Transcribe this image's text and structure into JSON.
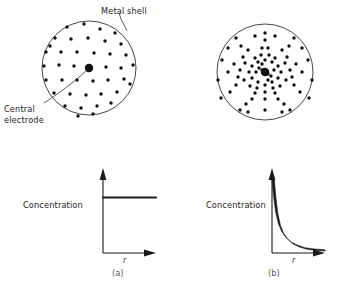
{
  "figure": {
    "caption_a": "(a)",
    "caption_b": "(b)"
  },
  "annotations": {
    "metal_shell": "Metal shell",
    "central_electrode_line1": "Central",
    "central_electrode_line2": "electrode"
  },
  "colors": {
    "line": "#1a1a1a",
    "dot": "#111111",
    "circle_stroke": "#333333",
    "text": "#222222",
    "background": "#ffffff"
  },
  "panel_a": {
    "circle": {
      "cx": 89,
      "cy": 68,
      "r": 47
    },
    "electrode": {
      "cx": 89,
      "cy": 68,
      "r": 4.2
    },
    "dot_radius": 1.7,
    "distribution": "uniform",
    "dots": [
      [
        67,
        27
      ],
      [
        84,
        24
      ],
      [
        100,
        29
      ],
      [
        115,
        33
      ],
      [
        55,
        38
      ],
      [
        71,
        39
      ],
      [
        88,
        38
      ],
      [
        105,
        41
      ],
      [
        121,
        44
      ],
      [
        46,
        52
      ],
      [
        61,
        52
      ],
      [
        77,
        52
      ],
      [
        94,
        53
      ],
      [
        110,
        54
      ],
      [
        126,
        55
      ],
      [
        44,
        66
      ],
      [
        59,
        65
      ],
      [
        74,
        66
      ],
      [
        106,
        67
      ],
      [
        121,
        68
      ],
      [
        133,
        65
      ],
      [
        46,
        80
      ],
      [
        62,
        80
      ],
      [
        77,
        80
      ],
      [
        93,
        81
      ],
      [
        108,
        80
      ],
      [
        124,
        79
      ],
      [
        54,
        93
      ],
      [
        70,
        94
      ],
      [
        86,
        95
      ],
      [
        101,
        94
      ],
      [
        117,
        92
      ],
      [
        65,
        106
      ],
      [
        81,
        108
      ],
      [
        97,
        106
      ],
      [
        111,
        103
      ],
      [
        78,
        116
      ],
      [
        93,
        114
      ],
      [
        50,
        46
      ],
      [
        130,
        84
      ],
      [
        88,
        70
      ]
    ]
  },
  "panel_b": {
    "circle": {
      "cx": 265,
      "cy": 72,
      "r": 48
    },
    "electrode": {
      "cx": 265,
      "cy": 72,
      "r": 4.2
    },
    "dot_radius": 1.7,
    "distribution": "radially-decaying",
    "dots": [
      [
        265,
        60
      ],
      [
        258,
        62
      ],
      [
        272,
        62
      ],
      [
        252,
        66
      ],
      [
        278,
        66
      ],
      [
        255,
        58
      ],
      [
        275,
        58
      ],
      [
        249,
        72
      ],
      [
        281,
        72
      ],
      [
        252,
        78
      ],
      [
        278,
        78
      ],
      [
        258,
        82
      ],
      [
        272,
        82
      ],
      [
        265,
        85
      ],
      [
        261,
        55
      ],
      [
        269,
        55
      ],
      [
        245,
        63
      ],
      [
        285,
        63
      ],
      [
        244,
        80
      ],
      [
        286,
        80
      ],
      [
        257,
        88
      ],
      [
        273,
        88
      ],
      [
        265,
        92
      ],
      [
        250,
        86
      ],
      [
        280,
        86
      ],
      [
        240,
        70
      ],
      [
        290,
        70
      ],
      [
        243,
        57
      ],
      [
        287,
        57
      ],
      [
        238,
        77
      ],
      [
        292,
        77
      ],
      [
        248,
        50
      ],
      [
        282,
        50
      ],
      [
        262,
        48
      ],
      [
        268,
        48
      ],
      [
        255,
        93
      ],
      [
        275,
        93
      ],
      [
        234,
        64
      ],
      [
        296,
        64
      ],
      [
        236,
        85
      ],
      [
        294,
        85
      ],
      [
        265,
        99
      ],
      [
        252,
        99
      ],
      [
        278,
        99
      ],
      [
        228,
        72
      ],
      [
        302,
        72
      ],
      [
        241,
        46
      ],
      [
        289,
        46
      ],
      [
        246,
        104
      ],
      [
        284,
        104
      ],
      [
        222,
        60
      ],
      [
        308,
        60
      ],
      [
        230,
        92
      ],
      [
        300,
        92
      ],
      [
        265,
        40
      ],
      [
        240,
        110
      ],
      [
        290,
        110
      ],
      [
        218,
        80
      ],
      [
        312,
        80
      ],
      [
        255,
        36
      ],
      [
        275,
        36
      ],
      [
        228,
        48
      ],
      [
        302,
        48
      ],
      [
        265,
        33
      ],
      [
        248,
        112
      ],
      [
        282,
        112
      ],
      [
        221,
        98
      ],
      [
        309,
        98
      ],
      [
        265,
        110
      ],
      [
        236,
        38
      ],
      [
        294,
        38
      ],
      [
        262,
        70
      ],
      [
        268,
        74
      ],
      [
        259,
        68
      ],
      [
        271,
        76
      ],
      [
        256,
        72
      ],
      [
        274,
        70
      ],
      [
        262,
        64
      ],
      [
        268,
        80
      ]
    ]
  },
  "chart_data": [
    {
      "type": "line",
      "panel": "a",
      "title": "",
      "ylabel": "Concentration",
      "xlabel": "r",
      "grid": false,
      "legend": null,
      "description": "Concentration is constant (flat) with radial distance for a uniform charge distribution",
      "x": [
        0,
        0.12,
        0.25,
        0.4,
        0.55,
        0.7,
        0.85,
        1.0
      ],
      "y": [
        0.72,
        0.72,
        0.72,
        0.72,
        0.72,
        0.72,
        0.72,
        0.72
      ],
      "xlim": [
        0,
        1
      ],
      "ylim": [
        0,
        1
      ]
    },
    {
      "type": "line",
      "panel": "b",
      "title": "",
      "ylabel": "Concentration",
      "xlabel": "r",
      "grid": false,
      "legend": null,
      "description": "Concentration decays sharply (approximately 1/r) with radial distance for a center-concentrated distribution",
      "x": [
        0.02,
        0.05,
        0.09,
        0.14,
        0.2,
        0.28,
        0.38,
        0.5,
        0.63,
        0.78,
        1.0
      ],
      "y": [
        0.97,
        0.74,
        0.52,
        0.37,
        0.27,
        0.19,
        0.13,
        0.09,
        0.06,
        0.045,
        0.035
      ],
      "xlim": [
        0,
        1
      ],
      "ylim": [
        0,
        1
      ]
    }
  ]
}
